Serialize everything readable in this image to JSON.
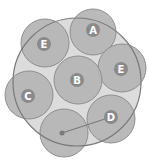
{
  "diagram": {
    "colors": {
      "background": "#ffffff",
      "outer_fill": "#dcdcdc",
      "outer_stroke": "#7a7a7a",
      "circle_fill": "#b4b4b4",
      "circle_stroke": "#8f8f8f",
      "badge_fill": "#8a8a8a",
      "label_color": "#ffffff",
      "connector_color": "#7a7a7a"
    },
    "outer_circle": {
      "cx": 77,
      "cy": 82,
      "r": 64
    },
    "circles": [
      {
        "id": "e1",
        "label": "E",
        "cx": 45,
        "cy": 43,
        "r": 24
      },
      {
        "id": "a",
        "label": "A",
        "cx": 93,
        "cy": 32,
        "r": 23
      },
      {
        "id": "e2",
        "label": "E",
        "cx": 122,
        "cy": 68,
        "r": 24
      },
      {
        "id": "b",
        "label": "B",
        "cx": 78,
        "cy": 80,
        "r": 24
      },
      {
        "id": "c",
        "label": "C",
        "cx": 29,
        "cy": 95,
        "r": 24
      },
      {
        "id": "x",
        "label": "",
        "cx": 64,
        "cy": 133,
        "r": 24
      },
      {
        "id": "d",
        "label": "D",
        "cx": 111,
        "cy": 119,
        "r": 24
      }
    ],
    "connector": {
      "from": "x",
      "to": "d",
      "x1": 62,
      "y1": 133,
      "x2": 111,
      "y2": 117
    }
  }
}
